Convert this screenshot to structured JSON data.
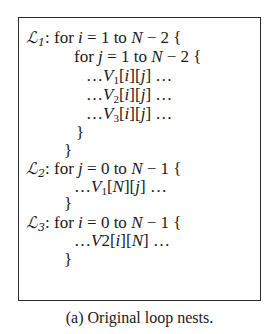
{
  "figure": {
    "caption": "(a) Original loop nests.",
    "loop_nests": [
      {
        "label": "L",
        "label_sub": "1",
        "lines": [
          "𝓛1: for i = 1 to N − 2 {",
          "for j = 1 to N − 2 {",
          ". . . V1[i][j] . . .",
          ". . . V2[i][j] . . .",
          ". . . V3[i][j] . . .",
          "}",
          "}"
        ]
      },
      {
        "label": "L",
        "label_sub": "2",
        "lines": [
          "𝓛2: for j = 0 to N − 1 {",
          ". . . V1[N][j] . . .",
          "}"
        ]
      },
      {
        "label": "L",
        "label_sub": "3",
        "lines": [
          "𝓛3: for i = 0 to N − 1 {",
          ". . . V2[i][N] . . .",
          "}"
        ]
      }
    ],
    "tokens": {
      "L_script": "ℒ",
      "colon": ":",
      "for": "for",
      "to": "to",
      "eq": "=",
      "minus": "−",
      "open_brace": "{",
      "close_brace": "}",
      "ellipsis": "…",
      "i": "i",
      "j": "j",
      "N": "N",
      "V": "V",
      "one": "1",
      "two": "2",
      "three": "3",
      "zero": "0",
      "lb": "[",
      "rb": "]"
    }
  }
}
